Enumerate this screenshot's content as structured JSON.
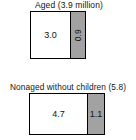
{
  "chart_data": {
    "type": "bar",
    "title": "",
    "subtitle": "",
    "xlabel": "",
    "ylabel": "",
    "orientation": "horizontal",
    "stacked": true,
    "grid": false,
    "legend_position": "none",
    "categories": [
      "Aged (3.9 million)",
      "Nonaged without children (5.8)"
    ],
    "series": [
      {
        "name": "white-segment",
        "values": [
          3.0,
          4.7
        ],
        "color": "#ffffff"
      },
      {
        "name": "gray-segment",
        "values": [
          0.9,
          1.1
        ],
        "color": "#a2a2a2"
      }
    ],
    "groups": [
      {
        "title": "Aged (3.9 million)",
        "total": 3.9,
        "segments": [
          {
            "label": "3.0",
            "value": 3.0,
            "color": "#ffffff",
            "rotated": false
          },
          {
            "label": "0.9",
            "value": 0.9,
            "color": "#a2a2a2",
            "rotated": true
          }
        ]
      },
      {
        "title": "Nonaged without children (5.8)",
        "total": 5.8,
        "segments": [
          {
            "label": "4.7",
            "value": 4.7,
            "color": "#ffffff",
            "rotated": false
          },
          {
            "label": "1.1",
            "value": 1.1,
            "color": "#a2a2a2",
            "rotated": false
          }
        ]
      }
    ]
  }
}
